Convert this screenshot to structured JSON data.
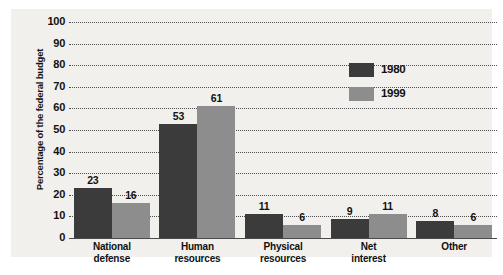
{
  "chart_data": {
    "type": "bar",
    "title": "",
    "xlabel": "",
    "ylabel": "Percentage of the federal budget",
    "ylim": [
      0,
      100
    ],
    "ytick_step": 10,
    "yticks": [
      "100",
      "90",
      "80",
      "70",
      "60",
      "50",
      "40",
      "30",
      "20",
      "10",
      "0"
    ],
    "grid": true,
    "grid_style": "dotted-horizontal",
    "legend_position": "upper-right-inside",
    "categories": [
      "National\ndefense",
      "Human\nresources",
      "Physical\nresources",
      "Net\ninterest",
      "Other"
    ],
    "category_lines": [
      [
        "National",
        "defense"
      ],
      [
        "Human",
        "resources"
      ],
      [
        "Physical",
        "resources"
      ],
      [
        "Net",
        "interest"
      ],
      [
        "Other"
      ]
    ],
    "series": [
      {
        "name": "1980",
        "color": "#3b3b3b",
        "values": [
          23,
          53,
          11,
          9,
          8
        ]
      },
      {
        "name": "1999",
        "color": "#8d8d8d",
        "values": [
          16,
          61,
          6,
          11,
          6
        ]
      }
    ],
    "data_labels": {
      "1980": [
        "23",
        "53",
        "11",
        "9",
        "8"
      ],
      "1999": [
        "16",
        "61",
        "6",
        "11",
        "6"
      ]
    }
  },
  "legend": {
    "items": [
      {
        "label": "1980",
        "color": "#3b3b3b"
      },
      {
        "label": "1999",
        "color": "#8d8d8d"
      }
    ]
  },
  "colors": {
    "series_1980": "#3b3b3b",
    "series_1999": "#8d8d8d",
    "panel_background": "#f1f0ed",
    "page_background": "#ffffff",
    "axis_line": "#4a4a4a",
    "gridline": "#4d4d4d",
    "text": "#111111"
  }
}
